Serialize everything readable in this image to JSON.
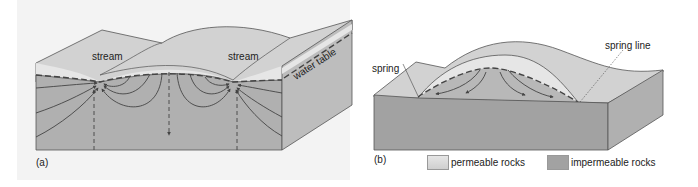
{
  "figure": {
    "panels": [
      {
        "id": "a",
        "label": "(a)",
        "annotations": {
          "stream_left": "stream",
          "stream_right": "stream",
          "water_table": "water table"
        }
      },
      {
        "id": "b",
        "label": "(b)",
        "annotations": {
          "spring": "spring",
          "spring_line": "spring line"
        }
      }
    ],
    "legend": [
      {
        "label": "permeable rocks",
        "color": "#dcdcdc"
      },
      {
        "label": "impermeable rocks",
        "color": "#a2a2a2"
      }
    ],
    "colors": {
      "background": "#f3f3f3",
      "surface": "#d6d6d6",
      "permeable": "#e4e4e4",
      "saturated": "#b0b0b0",
      "impermeable": "#a2a2a2",
      "side_face": "#bdbdbd",
      "line": "#444444"
    }
  }
}
